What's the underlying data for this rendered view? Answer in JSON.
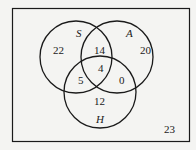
{
  "diagram": {
    "type": "venn-3",
    "sets": [
      {
        "id": "S",
        "label": "S"
      },
      {
        "id": "A",
        "label": "A"
      },
      {
        "id": "H",
        "label": "H"
      }
    ],
    "regions": {
      "S_only": "22",
      "A_only": "20",
      "H_only": "12",
      "S_A_only": "14",
      "S_H_only": "5",
      "A_H_only": "0",
      "S_A_H": "4",
      "outside": "23"
    },
    "colors": {
      "line": "#1a1a1a",
      "background": "#f4f4f2"
    }
  }
}
